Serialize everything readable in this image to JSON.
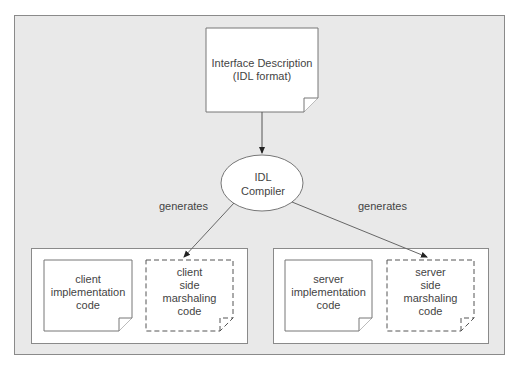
{
  "diagram": {
    "interface_doc": {
      "label": "Interface Description\n(IDL format)"
    },
    "compiler": {
      "label": "IDL\nCompiler"
    },
    "edge_labels": {
      "left": "generates",
      "right": "generates"
    },
    "client_group": {
      "impl": {
        "label": "client\nimplementation\ncode"
      },
      "marshaling": {
        "label": "client\nside\nmarshaling\ncode"
      }
    },
    "server_group": {
      "impl": {
        "label": "server\nimplementation\ncode"
      },
      "marshaling": {
        "label": "server\nside\nmarshaling\ncode"
      }
    }
  },
  "colors": {
    "background": "#e9e9e9",
    "border": "#8a8a8a",
    "box_fill": "#ffffff"
  }
}
